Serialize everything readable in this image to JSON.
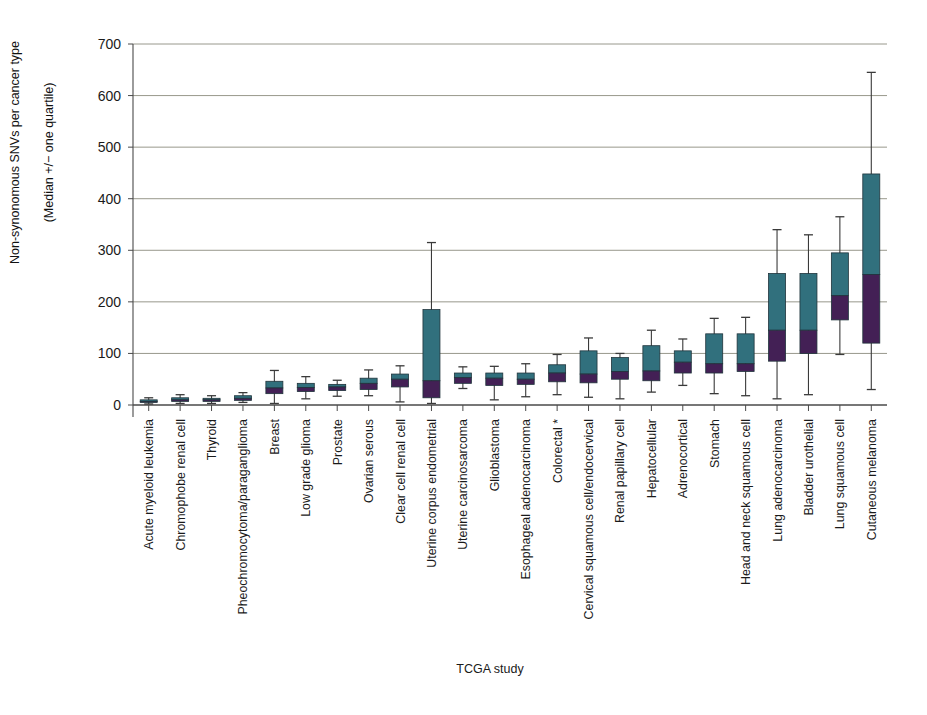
{
  "chart_data": {
    "type": "bar",
    "title": "",
    "xlabel": "TCGA study",
    "ylabel": "Non-synonomous SNVs per cancer type\n(Median +/− one quartile)",
    "ylabel_line1": "Non-synonomous SNVs per cancer type",
    "ylabel_line2": "(Median +/− one quartile)",
    "ylim": [
      0,
      700
    ],
    "yticks": [
      0,
      100,
      200,
      300,
      400,
      500,
      600,
      700
    ],
    "ytick_labels": [
      "0",
      "100",
      "200",
      "300",
      "400",
      "500",
      "600",
      "700"
    ],
    "grid": true,
    "legend": "none",
    "colors": {
      "upper_box": "#31707d",
      "lower_box": "#432055",
      "whisker": "#3a3a3a",
      "grid": "#8c8c7f",
      "axis": "#4a4a4a",
      "text": "#1a1a1a"
    },
    "categories": [
      "Acute myeloid leukemia",
      "Chromophobe renal cell",
      "Thyroid",
      "Pheochromocytoma/paraganglioma",
      "Breast",
      "Low grade glioma",
      "Prostate",
      "Ovarian serous",
      "Clear cell renal cell",
      "Uterine corpus endometrial",
      "Uterine carcinosarcoma",
      "Glioblastoma",
      "Esophageal adenocarcinoma",
      "Colorectal *",
      "Cervical squamous cell/endocervical",
      "Renal papillary cell",
      "Hepatocellular",
      "Adrenocortical",
      "Stomach",
      "Head and neck squamous cell",
      "Lung adenocarcinoma",
      "Bladder urothelial",
      "Lung squamous cell",
      "Cutaneous melanoma"
    ],
    "series": [
      {
        "name": "lower_quartile",
        "values": [
          5,
          7,
          7,
          9,
          22,
          26,
          28,
          30,
          35,
          14,
          42,
          38,
          40,
          45,
          43,
          50,
          47,
          62,
          62,
          65,
          85,
          100,
          165,
          120
        ]
      },
      {
        "name": "median",
        "values": [
          7,
          10,
          10,
          13,
          33,
          34,
          35,
          42,
          50,
          47,
          53,
          52,
          50,
          62,
          60,
          65,
          66,
          83,
          80,
          80,
          145,
          145,
          212,
          253
        ]
      },
      {
        "name": "upper_quartile",
        "values": [
          10,
          14,
          13,
          18,
          46,
          42,
          40,
          52,
          60,
          185,
          62,
          62,
          62,
          78,
          105,
          92,
          115,
          105,
          138,
          138,
          255,
          255,
          295,
          448
        ]
      },
      {
        "name": "whisker_min",
        "values": [
          2,
          3,
          3,
          5,
          3,
          12,
          17,
          18,
          6,
          3,
          32,
          10,
          16,
          20,
          15,
          12,
          25,
          38,
          22,
          18,
          12,
          20,
          98,
          30
        ]
      },
      {
        "name": "whisker_max",
        "values": [
          14,
          20,
          18,
          24,
          67,
          55,
          48,
          68,
          76,
          315,
          74,
          75,
          80,
          98,
          130,
          100,
          145,
          128,
          168,
          170,
          340,
          330,
          365,
          645
        ]
      }
    ],
    "boxes": [
      {
        "label": "Acute myeloid leukemia",
        "min": 2,
        "q1": 5,
        "median": 7,
        "q3": 10,
        "max": 14
      },
      {
        "label": "Chromophobe renal cell",
        "min": 3,
        "q1": 7,
        "median": 10,
        "q3": 14,
        "max": 20
      },
      {
        "label": "Thyroid",
        "min": 3,
        "q1": 7,
        "median": 10,
        "q3": 13,
        "max": 18
      },
      {
        "label": "Pheochromocytoma/paraganglioma",
        "min": 5,
        "q1": 9,
        "median": 13,
        "q3": 18,
        "max": 24
      },
      {
        "label": "Breast",
        "min": 3,
        "q1": 22,
        "median": 33,
        "q3": 46,
        "max": 67
      },
      {
        "label": "Low grade glioma",
        "min": 12,
        "q1": 26,
        "median": 34,
        "q3": 42,
        "max": 55
      },
      {
        "label": "Prostate",
        "min": 17,
        "q1": 28,
        "median": 35,
        "q3": 40,
        "max": 48
      },
      {
        "label": "Ovarian serous",
        "min": 18,
        "q1": 30,
        "median": 42,
        "q3": 52,
        "max": 68
      },
      {
        "label": "Clear cell renal cell",
        "min": 6,
        "q1": 35,
        "median": 50,
        "q3": 60,
        "max": 76
      },
      {
        "label": "Uterine corpus endometrial",
        "min": 3,
        "q1": 14,
        "median": 47,
        "q3": 185,
        "max": 315
      },
      {
        "label": "Uterine carcinosarcoma",
        "min": 32,
        "q1": 42,
        "median": 53,
        "q3": 62,
        "max": 74
      },
      {
        "label": "Glioblastoma",
        "min": 10,
        "q1": 38,
        "median": 52,
        "q3": 62,
        "max": 75
      },
      {
        "label": "Esophageal adenocarcinoma",
        "min": 16,
        "q1": 40,
        "median": 50,
        "q3": 62,
        "max": 80
      },
      {
        "label": "Colorectal *",
        "min": 20,
        "q1": 45,
        "median": 62,
        "q3": 78,
        "max": 98
      },
      {
        "label": "Cervical squamous cell/endocervical",
        "min": 15,
        "q1": 43,
        "median": 60,
        "q3": 105,
        "max": 130
      },
      {
        "label": "Renal papillary cell",
        "min": 12,
        "q1": 50,
        "median": 65,
        "q3": 92,
        "max": 100
      },
      {
        "label": "Hepatocellular",
        "min": 25,
        "q1": 47,
        "median": 66,
        "q3": 115,
        "max": 145
      },
      {
        "label": "Adrenocortical",
        "min": 38,
        "q1": 62,
        "median": 83,
        "q3": 105,
        "max": 128
      },
      {
        "label": "Stomach",
        "min": 22,
        "q1": 62,
        "median": 80,
        "q3": 138,
        "max": 168
      },
      {
        "label": "Head and neck squamous cell",
        "min": 18,
        "q1": 65,
        "median": 80,
        "q3": 138,
        "max": 170
      },
      {
        "label": "Lung adenocarcinoma",
        "min": 12,
        "q1": 85,
        "median": 145,
        "q3": 255,
        "max": 340
      },
      {
        "label": "Bladder urothelial",
        "min": 20,
        "q1": 100,
        "median": 145,
        "q3": 255,
        "max": 330
      },
      {
        "label": "Lung squamous cell",
        "min": 98,
        "q1": 165,
        "median": 212,
        "q3": 295,
        "max": 365
      },
      {
        "label": "Cutaneous melanoma",
        "min": 30,
        "q1": 120,
        "median": 253,
        "q3": 448,
        "max": 645
      }
    ]
  }
}
